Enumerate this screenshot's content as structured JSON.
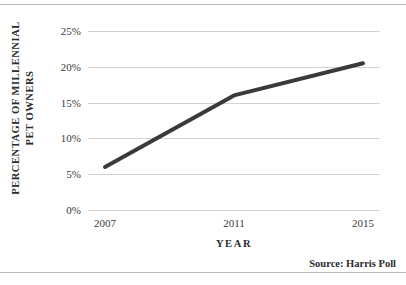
{
  "chart_data": {
    "type": "line",
    "title": "",
    "xlabel": "YEAR",
    "ylabel_line1": "PERCENTAGE OF MILLENNIAL",
    "ylabel_line2": "PET OWNERS",
    "categories": [
      "2007",
      "2011",
      "2015"
    ],
    "x": [
      2007,
      2011,
      2015
    ],
    "values": [
      6.0,
      16.0,
      20.5
    ],
    "series": [
      {
        "name": "Millennial pet owners",
        "values": [
          6.0,
          16.0,
          20.5
        ]
      }
    ],
    "ylim": [
      0,
      25
    ],
    "ytick_values": [
      0,
      5,
      10,
      15,
      20,
      25
    ],
    "ytick_labels": [
      "0%",
      "5%",
      "10%",
      "15%",
      "20%",
      "25%"
    ],
    "xtick_labels": [
      "2007",
      "2011",
      "2015"
    ],
    "grid": "horizontal",
    "legend": "none",
    "line_color": "#3a3a3a",
    "line_width": 4,
    "gridline_color": "#d2d2d2",
    "rule_color": "#b9b9b9",
    "background": "#ffffff"
  },
  "source": {
    "text": "Source: Harris Poll"
  }
}
